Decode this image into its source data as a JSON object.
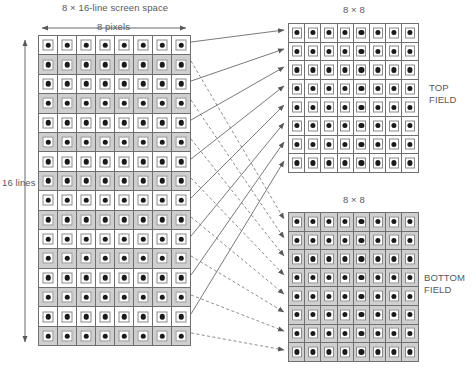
{
  "figure": {
    "title": "8 × 16-line screen space"
  },
  "labels": {
    "screen_space_title": "8 × 16-line screen space",
    "top_grid_title": "8 × 8",
    "bottom_grid_title": "8 × 8",
    "width_measure": "8 pixels",
    "height_measure": "16 lines",
    "top_field": "TOP\nFIELD",
    "top_field_line1": "TOP",
    "top_field_line2": "FIELD",
    "bottom_field_line1": "BOTTOM",
    "bottom_field_line2": "FIELD"
  },
  "colors": {
    "white_cell": "#ffffff",
    "gray_cell": "#cfcfcf",
    "cell_border": "#6f6f71",
    "inner_border": "#8a8a8c",
    "dot": "#1a1a1a",
    "text": "#58585a",
    "solid_line": "#58585a",
    "dashed_line": "#6f6f71",
    "background": "#ffffff"
  },
  "chart_data": {
    "type": "diagram",
    "title": "8 × 16-line screen space",
    "grids": [
      {
        "id": "screen-space",
        "name": "8 × 16-line screen space",
        "columns": 8,
        "rows": 16,
        "cell_pattern": "alternating-rows",
        "row_fills": [
          "white",
          "gray",
          "white",
          "gray",
          "white",
          "gray",
          "white",
          "gray",
          "white",
          "gray",
          "white",
          "gray",
          "white",
          "gray",
          "white",
          "gray"
        ],
        "annotations": {
          "width": "8 pixels",
          "height": "16 lines"
        }
      },
      {
        "id": "top-field",
        "name": "8 × 8",
        "label": "TOP FIELD",
        "columns": 8,
        "rows": 8,
        "cell_pattern": "uniform",
        "row_fills": [
          "white",
          "white",
          "white",
          "white",
          "white",
          "white",
          "white",
          "white"
        ]
      },
      {
        "id": "bottom-field",
        "name": "8 × 8",
        "label": "BOTTOM FIELD",
        "columns": 8,
        "rows": 8,
        "cell_pattern": "uniform",
        "row_fills": [
          "gray",
          "gray",
          "gray",
          "gray",
          "gray",
          "gray",
          "gray",
          "gray"
        ]
      }
    ],
    "mappings": [
      {
        "style": "solid",
        "from_grid": "screen-space",
        "from_rows": [
          1,
          3,
          5,
          7,
          9,
          11,
          13,
          15
        ],
        "to_grid": "top-field",
        "to_rows": [
          1,
          2,
          3,
          4,
          5,
          6,
          7,
          8
        ]
      },
      {
        "style": "dashed",
        "from_grid": "screen-space",
        "from_rows": [
          2,
          4,
          6,
          8,
          10,
          12,
          14,
          16
        ],
        "to_grid": "bottom-field",
        "to_rows": [
          1,
          2,
          3,
          4,
          5,
          6,
          7,
          8
        ]
      }
    ]
  }
}
